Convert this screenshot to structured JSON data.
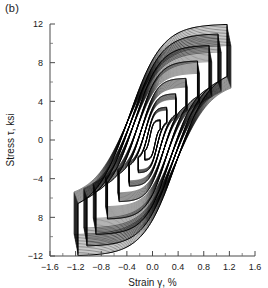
{
  "panel": {
    "label": "(b)"
  },
  "chart_data": {
    "type": "line",
    "title": "",
    "subtitle": "",
    "xlabel": "Strain γ, %",
    "ylabel": "Stress τ, ksi",
    "xlim": [
      -1.6,
      1.6
    ],
    "ylim": [
      -12,
      12
    ],
    "xticks": [
      -1.6,
      -1.2,
      -0.8,
      -0.4,
      0.0,
      0.4,
      0.8,
      1.2,
      1.6
    ],
    "xticklabels": [
      "−1.6",
      "−1.2",
      "−0.8",
      "−0.4",
      "0.0",
      "0.4",
      "0.8",
      "1.2",
      "1.6"
    ],
    "yticks": [
      -12,
      -8,
      -4,
      0,
      4,
      8,
      12
    ],
    "yticklabels": [
      "−12",
      "8",
      "−4",
      "0",
      "4",
      "8",
      "12"
    ],
    "x_minor_step": 0.2,
    "y_minor_step": 2,
    "grid": false,
    "legend": null,
    "annotations": [
      {
        "text": "(b)",
        "x_px": 5,
        "y_px": 2
      }
    ],
    "series": [
      {
        "name": "cycle-amplitude-1",
        "strain_amplitude": 0.12,
        "stress_amplitude": 2.1,
        "repeats": 6
      },
      {
        "name": "cycle-amplitude-2",
        "strain_amplitude": 0.22,
        "stress_amplitude": 3.4,
        "repeats": 8
      },
      {
        "name": "cycle-amplitude-3",
        "strain_amplitude": 0.36,
        "stress_amplitude": 4.8,
        "repeats": 10
      },
      {
        "name": "cycle-amplitude-4",
        "strain_amplitude": 0.52,
        "stress_amplitude": 6.4,
        "repeats": 12
      },
      {
        "name": "cycle-amplitude-5",
        "strain_amplitude": 0.7,
        "stress_amplitude": 8.2,
        "repeats": 13
      },
      {
        "name": "cycle-amplitude-6",
        "strain_amplitude": 0.88,
        "stress_amplitude": 9.8,
        "repeats": 14
      },
      {
        "name": "cycle-amplitude-7",
        "strain_amplitude": 1.02,
        "stress_amplitude": 11.0,
        "repeats": 14
      },
      {
        "name": "cycle-amplitude-8",
        "strain_amplitude": 1.16,
        "stress_amplitude": 12.0,
        "repeats": 15
      }
    ]
  },
  "colors": {
    "line": "#000000",
    "axis": "#4a4a4a",
    "background": "#ffffff"
  }
}
